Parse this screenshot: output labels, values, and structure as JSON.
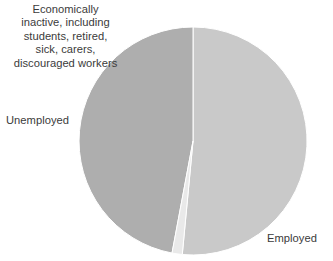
{
  "chart_data": {
    "type": "pie",
    "title": "",
    "subtitle": "",
    "xlabel": "",
    "ylabel": "",
    "grid": false,
    "legend_position": "none",
    "labels_outside": true,
    "start_angle_deg": 0,
    "direction": "clockwise",
    "categories": [
      "Employed",
      "Economically inactive, including students, retired, sick, carers, discouraged workers",
      "Unemployed"
    ],
    "values": [
      51.5,
      47.0,
      1.5
    ],
    "slices": [
      {
        "name": "Employed",
        "label": "Employed",
        "value": 51.5,
        "color": "#c9c9c9",
        "start_deg": 0,
        "end_deg": 185.4
      },
      {
        "name": "Economically inactive",
        "label": "Economically inactive, including students, retired, sick, carers, discouraged workers",
        "value": 47.0,
        "color": "#aeaeae",
        "start_deg": 190.6,
        "end_deg": 360
      },
      {
        "name": "Unemployed",
        "label": "Unemployed",
        "value": 1.5,
        "color": "#e9e9e9",
        "start_deg": 185.4,
        "end_deg": 190.6
      }
    ]
  },
  "labels": {
    "inactive": "Economically\ninactive, including\nstudents, retired,\nsick, carers,\ndiscouraged workers",
    "unemployed": "Unemployed",
    "employed": "Employed"
  },
  "colors": {
    "background": "#ffffff",
    "text": "#3b3b3b",
    "employed": "#c9c9c9",
    "inactive": "#aeaeae",
    "unemployed": "#e9e9e9",
    "separator": "#ffffff"
  },
  "geometry": {
    "center_x": 193,
    "center_y": 141,
    "radius": 114
  }
}
